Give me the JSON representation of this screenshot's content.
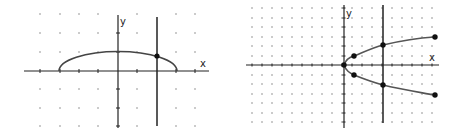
{
  "figures": [
    {
      "id": "graph-left",
      "description": "Upper half of an ellipse with a vertical line x = 2 and a marked intersection point",
      "axis_labels": {
        "x": "x",
        "y": "y"
      },
      "grid": {
        "x_range": [
          -4,
          4
        ],
        "y_range": [
          -3,
          3
        ],
        "unit_px": 19.5,
        "origin_px": [
          118,
          71
        ]
      },
      "curve": {
        "type": "upper-semi-ellipse",
        "x_from": -3,
        "x_to": 3,
        "peak_y": 1
      },
      "vertical_line": {
        "x": 2
      },
      "points": [
        {
          "x": 2,
          "y": 0.8
        }
      ]
    },
    {
      "id": "graph-right",
      "description": "Sideways parabola x = y^2 (both branches) with vertical line x = 4 and marked points",
      "axis_labels": {
        "x": "x",
        "y": "y"
      },
      "grid": {
        "x_range": [
          -10,
          9
        ],
        "y_range": [
          -6,
          6
        ],
        "unit_px": 10,
        "origin_px": [
          344,
          65
        ]
      },
      "curve": {
        "type": "sideways-parabola",
        "equation": "x = y^2"
      },
      "vertical_line": {
        "x": 4
      },
      "points": [
        {
          "x": 0,
          "y": 0
        },
        {
          "x": 1,
          "y": 1
        },
        {
          "x": 1,
          "y": -1
        },
        {
          "x": 4,
          "y": 2
        },
        {
          "x": 4,
          "y": -2
        },
        {
          "x": 9,
          "y": 3
        },
        {
          "x": 9,
          "y": -3
        }
      ]
    }
  ],
  "colors": {
    "line": "#222222",
    "curve": "#444444",
    "grid_dot": "#8a8a8a",
    "point": "#111111"
  }
}
